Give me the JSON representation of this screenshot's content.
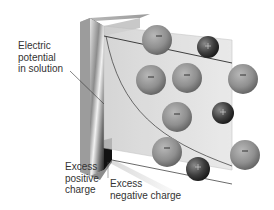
{
  "figure": {
    "labels": {
      "potential": [
        "Electric",
        "potential",
        "in solution"
      ],
      "positive": [
        "Excess",
        "positive",
        "charge"
      ],
      "negative": [
        "Excess",
        "negative charge"
      ]
    },
    "ion_signs": {
      "anion": "−",
      "cation": "+"
    },
    "colors": {
      "electrode_dark": "#2a2a2a",
      "electrode_light": "#d8d8d8",
      "solution_panel": "#dcdcdc",
      "anion": "#8a8a8a",
      "cation": "#3a3a3a",
      "text": "#333333",
      "line": "#2b2b2b"
    }
  }
}
